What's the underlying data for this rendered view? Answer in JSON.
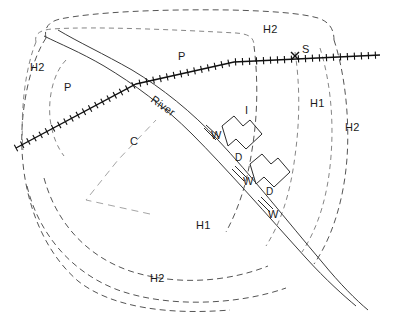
{
  "figure": {
    "name": "hydrological-catchment-map",
    "width": 413,
    "height": 321,
    "background_color": "#ffffff"
  },
  "style_colors": {
    "contour_stroke": "#555555",
    "fine_contour_stroke": "#777777",
    "field_boundary_stroke": "#9a9a9a",
    "river_stroke": "#3b3b3b",
    "railway_stroke": "#111111",
    "structure_stroke": "#2a2a2a",
    "label_text": "#1a1a1a"
  },
  "legend_codes": {
    "P": "P",
    "C": "C",
    "I": "I",
    "S": "S",
    "W": "W",
    "D": "D",
    "H1": "H1",
    "H2": "H2"
  },
  "labels": [
    {
      "id": "label-h2-top",
      "text": "H2",
      "x": 263,
      "y": 24,
      "rotate": 0,
      "size": "normal"
    },
    {
      "id": "label-p-upper",
      "text": "P",
      "x": 178,
      "y": 51,
      "rotate": 0,
      "size": "normal"
    },
    {
      "id": "label-s-station",
      "text": "S",
      "x": 302,
      "y": 44,
      "rotate": 0,
      "size": "normal"
    },
    {
      "id": "label-h2-left",
      "text": "H2",
      "x": 30,
      "y": 62,
      "rotate": 0,
      "size": "normal"
    },
    {
      "id": "label-p-left",
      "text": "P",
      "x": 64,
      "y": 82,
      "rotate": 0,
      "size": "normal"
    },
    {
      "id": "label-river",
      "text": "River",
      "x": 152,
      "y": 93,
      "rotate": 35,
      "size": "normal"
    },
    {
      "id": "label-i-interfluve",
      "text": "I",
      "x": 245,
      "y": 105,
      "rotate": 0,
      "size": "normal"
    },
    {
      "id": "label-h1-right",
      "text": "H1",
      "x": 310,
      "y": 98,
      "rotate": 0,
      "size": "normal"
    },
    {
      "id": "label-h2-right",
      "text": "H2",
      "x": 345,
      "y": 122,
      "rotate": 0,
      "size": "normal"
    },
    {
      "id": "label-c-channel",
      "text": "C",
      "x": 130,
      "y": 136,
      "rotate": 0,
      "size": "normal"
    },
    {
      "id": "label-w-upper",
      "text": "W",
      "x": 211,
      "y": 130,
      "rotate": 0,
      "size": "normal"
    },
    {
      "id": "label-d-upper",
      "text": "D",
      "x": 235,
      "y": 153,
      "rotate": 0,
      "size": "small"
    },
    {
      "id": "label-w-middle",
      "text": "W",
      "x": 243,
      "y": 176,
      "rotate": 0,
      "size": "normal"
    },
    {
      "id": "label-d-lower",
      "text": "D",
      "x": 266,
      "y": 187,
      "rotate": 0,
      "size": "small"
    },
    {
      "id": "label-w-lower",
      "text": "W",
      "x": 268,
      "y": 209,
      "rotate": 0,
      "size": "normal"
    },
    {
      "id": "label-h1-bottom",
      "text": "H1",
      "x": 196,
      "y": 220,
      "rotate": 0,
      "size": "normal"
    },
    {
      "id": "label-h2-bottom",
      "text": "H2",
      "x": 150,
      "y": 273,
      "rotate": 0,
      "size": "normal"
    }
  ],
  "geometry": {
    "contours": [
      {
        "id": "contour-outer-h2",
        "d": "M 46 38 C 44 28, 48 22, 60 19 C 95 12, 160 9, 230 10 C 270 11, 300 13, 318 18 C 330 22, 334 30, 334 40"
      },
      {
        "id": "contour-upper-inner-h2",
        "d": "M 36 42 C 34 34, 40 30, 52 29 C 96 26, 180 30, 236 33 C 250 34, 254 38, 254 46"
      },
      {
        "id": "contour-left-outer",
        "d": "M 46 38 C 30 62, 20 110, 22 150 C 24 196, 40 248, 78 281 C 112 308, 170 315, 230 310"
      },
      {
        "id": "contour-left-mid",
        "d": "M 36 42 C 26 66, 20 108, 23 150"
      },
      {
        "id": "contour-left-inner-p",
        "d": "M 66 60 C 54 72, 48 96, 50 118 C 52 136, 58 148, 64 156"
      },
      {
        "id": "contour-bottom-h2-outer",
        "d": "M 27 186 C 38 232, 70 272, 118 290 C 168 308, 238 305, 286 288"
      },
      {
        "id": "contour-bottom-h1",
        "d": "M 44 178 C 56 222, 86 256, 130 271 C 176 286, 228 282, 268 266"
      },
      {
        "id": "contour-right-h2-outer",
        "d": "M 334 40 C 344 70, 350 116, 347 158 C 344 200, 332 238, 314 264"
      },
      {
        "id": "contour-right-mid",
        "d": "M 320 48 C 330 80, 334 118, 331 156 C 328 196, 318 228, 302 252"
      },
      {
        "id": "contour-right-inner",
        "d": "M 295 52 C 300 84, 300 120, 295 156 C 290 196, 280 224, 266 246"
      },
      {
        "id": "contour-right-i-edge",
        "d": "M 254 46 C 258 78, 258 114, 252 150 C 247 184, 238 210, 226 232"
      }
    ],
    "railway": {
      "id": "railway-line",
      "d": "M 16 148 L 136 84 L 234 62 L 380 55",
      "tie_spacing": 7,
      "tie_half_length": 3.6
    },
    "station": {
      "id": "station-marker-s",
      "x": 295,
      "y": 56,
      "size": 4
    },
    "river_banks": [
      {
        "id": "river-bank-left",
        "d": "M 44 36 C 60 44, 80 52, 104 66 C 134 84, 164 106, 192 134 C 226 168, 268 216, 306 258 C 326 280, 344 296, 356 306"
      },
      {
        "id": "river-bank-right",
        "d": "M 58 30 C 78 42, 104 54, 132 70 C 162 88, 192 112, 218 140 C 250 174, 288 222, 322 262 C 340 284, 356 300, 368 310"
      }
    ],
    "field_boundary": {
      "id": "field-boundary-polygon",
      "d": "M 150 214 L 86 200 L 118 160 L 156 120"
    },
    "structures": [
      {
        "id": "weir-upper",
        "type": "weir",
        "d": "M 204 128 L 216 140 M 206 125 L 219 137"
      },
      {
        "id": "basin-upper-d",
        "type": "basin",
        "d": "M 222 126 L 234 116 L 243 126 L 250 120 L 262 134 L 246 149 L 236 139 L 228 146 Z"
      },
      {
        "id": "weir-middle",
        "type": "weir",
        "d": "M 232 169 L 244 181 M 235 166 L 247 178"
      },
      {
        "id": "basin-lower-d",
        "type": "basin",
        "d": "M 250 164 L 262 154 L 271 164 L 278 158 L 290 172 L 274 187 L 264 177 L 256 184 Z"
      },
      {
        "id": "weir-lower",
        "type": "weir",
        "d": "M 258 200 L 270 212 M 261 197 L 273 209"
      }
    ]
  }
}
